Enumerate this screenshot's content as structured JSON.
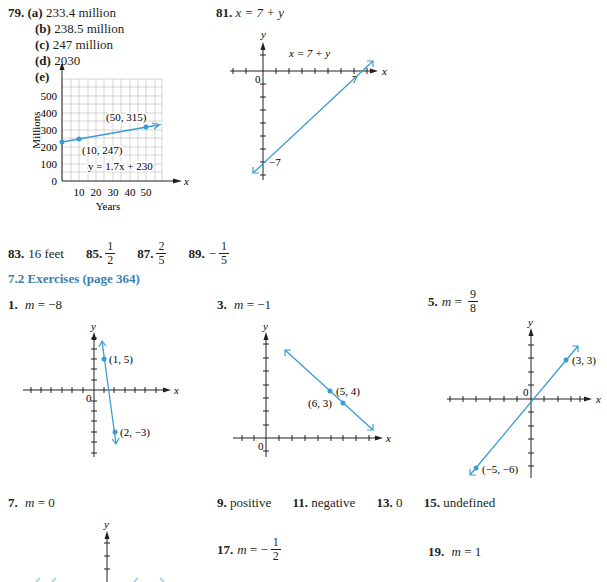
{
  "problem79": {
    "number": "79.",
    "parts": [
      {
        "label": "(a)",
        "value": "233.4 million"
      },
      {
        "label": "(b)",
        "value": "238.5 million"
      },
      {
        "label": "(c)",
        "value": "247 million"
      },
      {
        "label": "(d)",
        "value": "2030"
      },
      {
        "label": "(e)",
        "value": ""
      }
    ],
    "graph": {
      "y_axis_label": "y",
      "x_axis_label": "x",
      "y_title": "Millions",
      "x_title": "Years",
      "y_ticks": [
        "500",
        "400",
        "300",
        "200",
        "100",
        "0"
      ],
      "x_ticks": [
        "10",
        "20",
        "30",
        "40",
        "50"
      ],
      "point1": "(10, 247)",
      "point2": "(50, 315)",
      "equation": "y = 1.7x + 230"
    }
  },
  "problem81": {
    "number": "81.",
    "equation": "x = 7 + y",
    "graph": {
      "y_axis_label": "y",
      "x_axis_label": "x",
      "origin": "0",
      "equation_label": "x = 7 + y",
      "x_intercept": "7",
      "y_intercept": "−7"
    }
  },
  "answers_row": [
    {
      "number": "83.",
      "text": "16 feet"
    },
    {
      "number": "85.",
      "numerator": "1",
      "denominator": "2",
      "sign": ""
    },
    {
      "number": "87.",
      "numerator": "2",
      "denominator": "5",
      "sign": ""
    },
    {
      "number": "89.",
      "numerator": "1",
      "denominator": "5",
      "sign": "−"
    }
  ],
  "section_heading": "7.2 Exercises (page 364)",
  "exercises": {
    "ex1": {
      "number": "1.",
      "var": "m",
      "eq": " = −8",
      "graph": {
        "y": "y",
        "x": "x",
        "origin": "0",
        "p1": "(1, 5)",
        "p2": "(2, −3)"
      }
    },
    "ex3": {
      "number": "3.",
      "var": "m",
      "eq": " = −1",
      "graph": {
        "y": "y",
        "x": "x",
        "origin": "0",
        "p1": "(5, 4)",
        "p2": "(6, 3)"
      }
    },
    "ex5": {
      "number": "5.",
      "var": "m",
      "eq": " = ",
      "numerator": "9",
      "denominator": "8",
      "graph": {
        "y": "y",
        "x": "x",
        "origin": "0",
        "p1": "(3, 3)",
        "p2": "(−5, −6)"
      }
    },
    "ex7": {
      "number": "7.",
      "var": "m",
      "eq": " = 0",
      "graph": {
        "y": "y"
      }
    },
    "ex9": {
      "number": "9.",
      "text": "positive"
    },
    "ex11": {
      "number": "11.",
      "text": "negative"
    },
    "ex13": {
      "number": "13.",
      "text": "0"
    },
    "ex15": {
      "number": "15.",
      "text": "undefined"
    },
    "ex17": {
      "number": "17.",
      "var": "m",
      "eq": " = −",
      "numerator": "1",
      "denominator": "2"
    },
    "ex19": {
      "number": "19.",
      "var": "m",
      "eq": " = 1"
    }
  },
  "colors": {
    "accent": "#3a9bd5",
    "heading": "#3a7fb0",
    "text": "#231f20"
  }
}
